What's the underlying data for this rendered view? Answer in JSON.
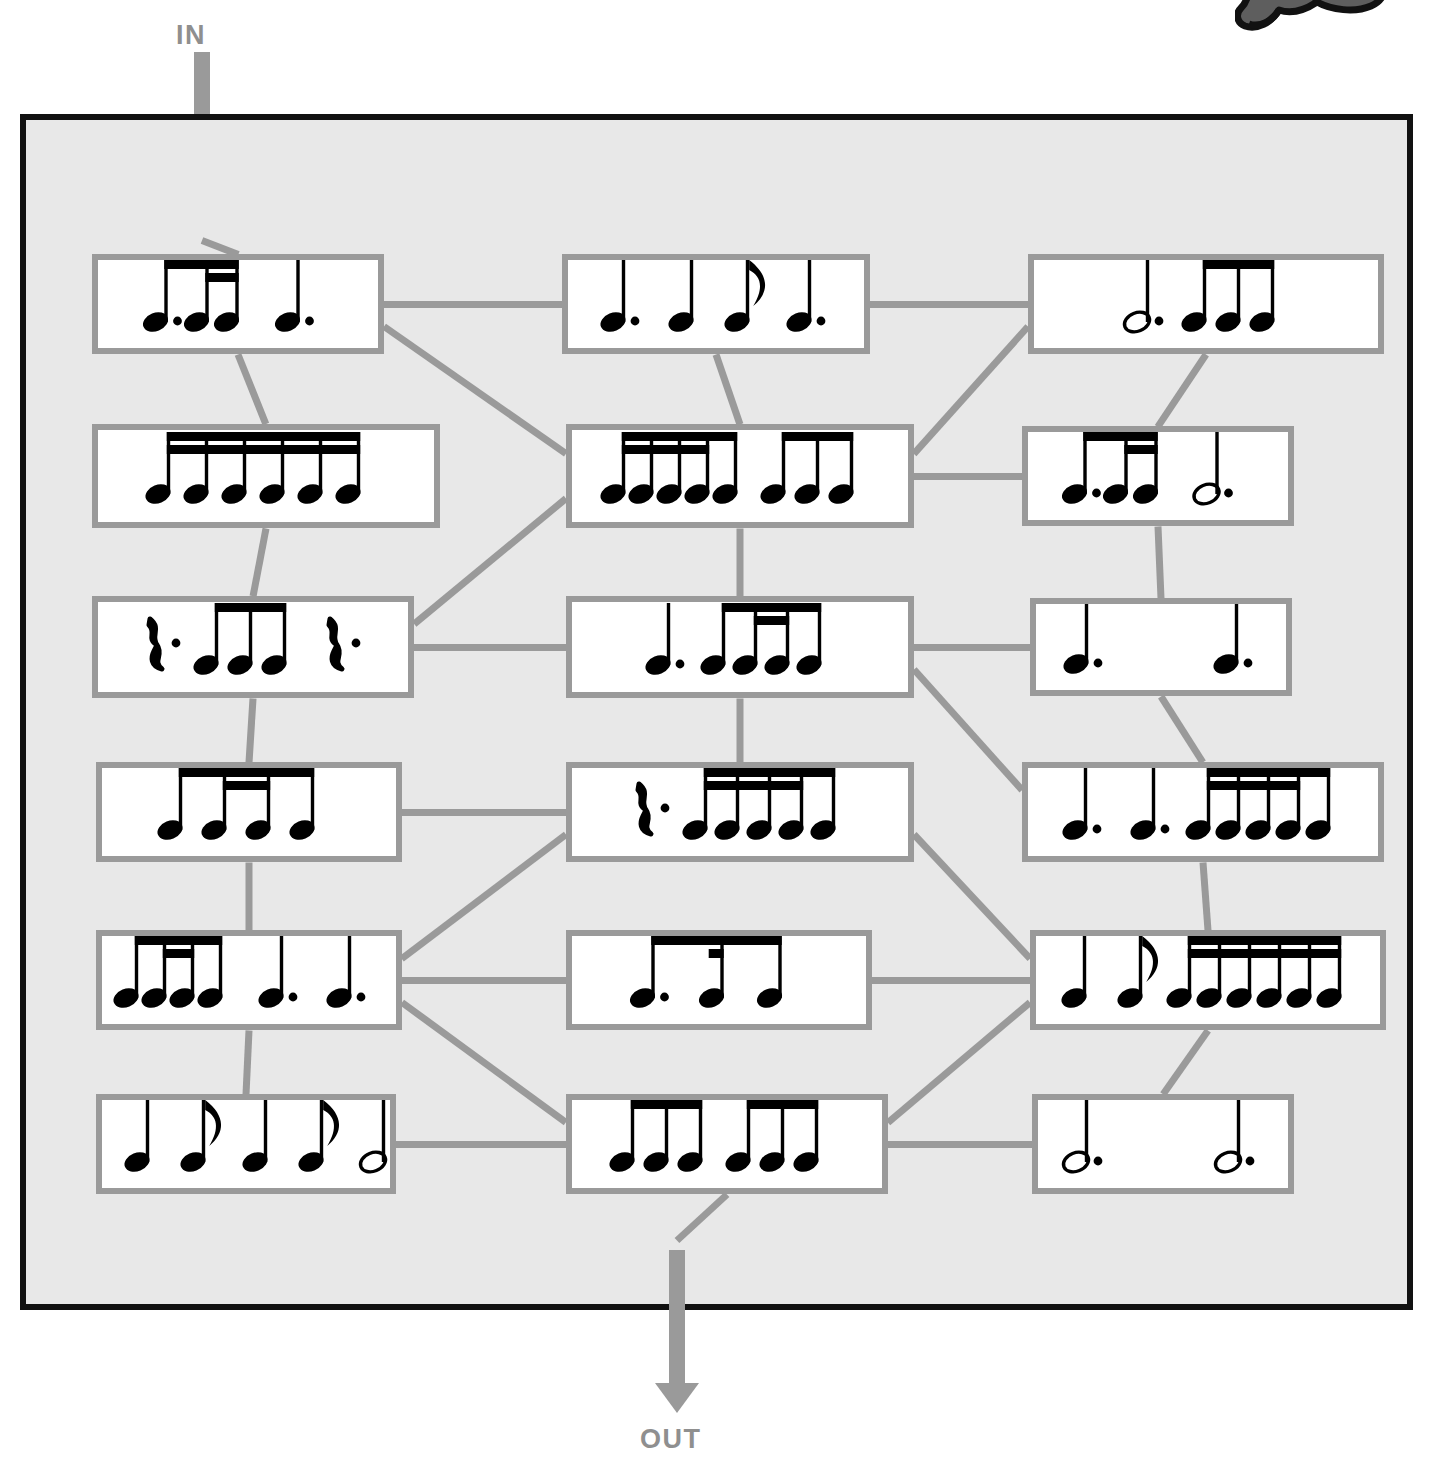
{
  "page": {
    "background_color": "#ffffff",
    "maze_fill": "#e8e8e8",
    "maze_border_color": "#111111",
    "box_border_color": "#9a9a9a",
    "box_fill": "#ffffff",
    "connector_color": "#9a9a9a",
    "arrow_color": "#9a9a9a",
    "label_color": "#8f8f8f"
  },
  "labels": {
    "in": "IN",
    "out": "OUT"
  },
  "logo": {
    "name": "panther-mascot-logo",
    "description": "cartoon panther mascot, cropped at top edge",
    "color": "#5e5e5e",
    "outline": "#111111"
  },
  "arrows": [
    {
      "name": "in-arrow",
      "direction": "down",
      "label": "IN"
    },
    {
      "name": "out-arrow",
      "direction": "down",
      "label": "OUT"
    }
  ],
  "maze": {
    "columns": 3,
    "rows": 6,
    "cells": [
      {
        "id": "r1c1",
        "row": 1,
        "col": 1,
        "x": 92,
        "y": 254,
        "w": 292,
        "h": 100,
        "notation": "dotted eighth + two sixteenths (beamed), dotted quarter",
        "glyphs": "♪. ♬ ♩.",
        "beats": 3
      },
      {
        "id": "r1c2",
        "row": 1,
        "col": 2,
        "x": 562,
        "y": 254,
        "w": 308,
        "h": 100,
        "notation": "dotted quarter, quarter, eighth, dotted quarter",
        "glyphs": "♩. ♩ ♪ ♩.",
        "beats": 4
      },
      {
        "id": "r1c3",
        "row": 1,
        "col": 3,
        "x": 1028,
        "y": 254,
        "w": 356,
        "h": 100,
        "notation": "dotted half, three eighths (beamed)",
        "glyphs": "𝅗𝅥. ♫♪",
        "beats": 4.5
      },
      {
        "id": "r2c1",
        "row": 2,
        "col": 1,
        "x": 92,
        "y": 424,
        "w": 348,
        "h": 104,
        "notation": "six sixteenth notes beamed in three pairs",
        "glyphs": "♬♬♬",
        "beats": 1.5
      },
      {
        "id": "r2c2",
        "row": 2,
        "col": 2,
        "x": 566,
        "y": 424,
        "w": 348,
        "h": 104,
        "notation": "four sixteenths + eighth (beamed), three eighths (beamed)",
        "glyphs": "♬♬♪ ♪♪♪",
        "beats": 3
      },
      {
        "id": "r2c3",
        "row": 2,
        "col": 3,
        "x": 1022,
        "y": 426,
        "w": 272,
        "h": 100,
        "notation": "dotted eighth + two sixteenths (beamed), dotted half",
        "glyphs": "♪. ♬ 𝅗𝅥.",
        "beats": 4
      },
      {
        "id": "r3c1",
        "row": 3,
        "col": 1,
        "x": 92,
        "y": 596,
        "w": 322,
        "h": 102,
        "notation": "dotted quarter rest, three eighths (beamed), dotted quarter rest",
        "glyphs": "𝄽. ♪♪♪ 𝄽.",
        "beats": 4.5
      },
      {
        "id": "r3c2",
        "row": 3,
        "col": 2,
        "x": 566,
        "y": 596,
        "w": 348,
        "h": 102,
        "notation": "dotted quarter, eighth + two sixteenths + eighth (beamed)",
        "glyphs": "♩. ♪♬♪",
        "beats": 3
      },
      {
        "id": "r3c3",
        "row": 3,
        "col": 3,
        "x": 1030,
        "y": 598,
        "w": 262,
        "h": 98,
        "notation": "dotted quarter, dotted quarter",
        "glyphs": "♩. ♩.",
        "beats": 3
      },
      {
        "id": "r4c1",
        "row": 4,
        "col": 1,
        "x": 96,
        "y": 762,
        "w": 306,
        "h": 100,
        "notation": "eighth + two sixteenths + eighth (beamed)",
        "glyphs": "♪♬♪",
        "beats": 2
      },
      {
        "id": "r4c2",
        "row": 4,
        "col": 2,
        "x": 566,
        "y": 762,
        "w": 348,
        "h": 100,
        "notation": "dotted quarter rest, four sixteenths + eighth (beamed)",
        "glyphs": "𝄽. ♬♬♪",
        "beats": 3
      },
      {
        "id": "r4c3",
        "row": 4,
        "col": 3,
        "x": 1022,
        "y": 762,
        "w": 362,
        "h": 100,
        "notation": "dotted quarter, dotted quarter, five notes beamed",
        "glyphs": "♩. ♩. ♬♬♪",
        "beats": 4.5
      },
      {
        "id": "r5c1",
        "row": 5,
        "col": 1,
        "x": 96,
        "y": 930,
        "w": 306,
        "h": 100,
        "notation": "eighth + two sixteenths + eighth (beamed), dotted quarter, dotted quarter",
        "glyphs": "♪♬♪ ♩. ♩.",
        "beats": 5
      },
      {
        "id": "r5c2",
        "row": 5,
        "col": 2,
        "x": 566,
        "y": 930,
        "w": 306,
        "h": 100,
        "notation": "dotted eighth + sixteenth + eighth (beamed)",
        "glyphs": "♪.♬♪",
        "beats": 1.5
      },
      {
        "id": "r5c3",
        "row": 5,
        "col": 3,
        "x": 1030,
        "y": 930,
        "w": 356,
        "h": 100,
        "notation": "quarter, eighth (flagged), six sixteenths (beamed)",
        "glyphs": "♩ ♪ ♬♬♬",
        "beats": 3
      },
      {
        "id": "r6c1",
        "row": 6,
        "col": 1,
        "x": 96,
        "y": 1094,
        "w": 300,
        "h": 100,
        "notation": "quarter, eighth, quarter, eighth, dotted half",
        "glyphs": "♩ ♪ ♩ ♪ 𝅗𝅥.",
        "beats": 6
      },
      {
        "id": "r6c2",
        "row": 6,
        "col": 2,
        "x": 566,
        "y": 1094,
        "w": 322,
        "h": 100,
        "notation": "three eighths (beamed), three eighths (beamed)",
        "glyphs": "♪♪♪ ♪♪♪",
        "beats": 3
      },
      {
        "id": "r6c3",
        "row": 6,
        "col": 3,
        "x": 1032,
        "y": 1094,
        "w": 262,
        "h": 100,
        "notation": "dotted half, dotted half",
        "glyphs": "𝅗𝅥. 𝅗𝅥.",
        "beats": 6
      }
    ],
    "connections": [
      {
        "from": "in-arrow",
        "to": "r1c1"
      },
      {
        "from": "r1c1",
        "to": "r1c2"
      },
      {
        "from": "r1c2",
        "to": "r1c3"
      },
      {
        "from": "r1c1",
        "to": "r2c1"
      },
      {
        "from": "r1c1",
        "to": "r2c2"
      },
      {
        "from": "r1c2",
        "to": "r2c2"
      },
      {
        "from": "r1c3",
        "to": "r2c2"
      },
      {
        "from": "r1c3",
        "to": "r2c3"
      },
      {
        "from": "r2c2",
        "to": "r2c3"
      },
      {
        "from": "r2c1",
        "to": "r3c1"
      },
      {
        "from": "r2c2",
        "to": "r3c1"
      },
      {
        "from": "r2c2",
        "to": "r3c2"
      },
      {
        "from": "r2c3",
        "to": "r3c3"
      },
      {
        "from": "r3c1",
        "to": "r3c2"
      },
      {
        "from": "r3c2",
        "to": "r3c3"
      },
      {
        "from": "r3c1",
        "to": "r4c1"
      },
      {
        "from": "r3c2",
        "to": "r4c2"
      },
      {
        "from": "r3c2",
        "to": "r4c3"
      },
      {
        "from": "r3c3",
        "to": "r4c3"
      },
      {
        "from": "r4c1",
        "to": "r4c2"
      },
      {
        "from": "r4c1",
        "to": "r5c1"
      },
      {
        "from": "r4c2",
        "to": "r5c1"
      },
      {
        "from": "r4c2",
        "to": "r5c3"
      },
      {
        "from": "r4c3",
        "to": "r5c3"
      },
      {
        "from": "r5c1",
        "to": "r5c2"
      },
      {
        "from": "r5c2",
        "to": "r5c3"
      },
      {
        "from": "r5c1",
        "to": "r6c2"
      },
      {
        "from": "r5c3",
        "to": "r6c2"
      },
      {
        "from": "r5c3",
        "to": "r6c3"
      },
      {
        "from": "r5c1",
        "to": "r6c1"
      },
      {
        "from": "r6c1",
        "to": "r6c2"
      },
      {
        "from": "r6c2",
        "to": "r6c3"
      },
      {
        "from": "r6c2",
        "to": "out-arrow"
      }
    ]
  }
}
